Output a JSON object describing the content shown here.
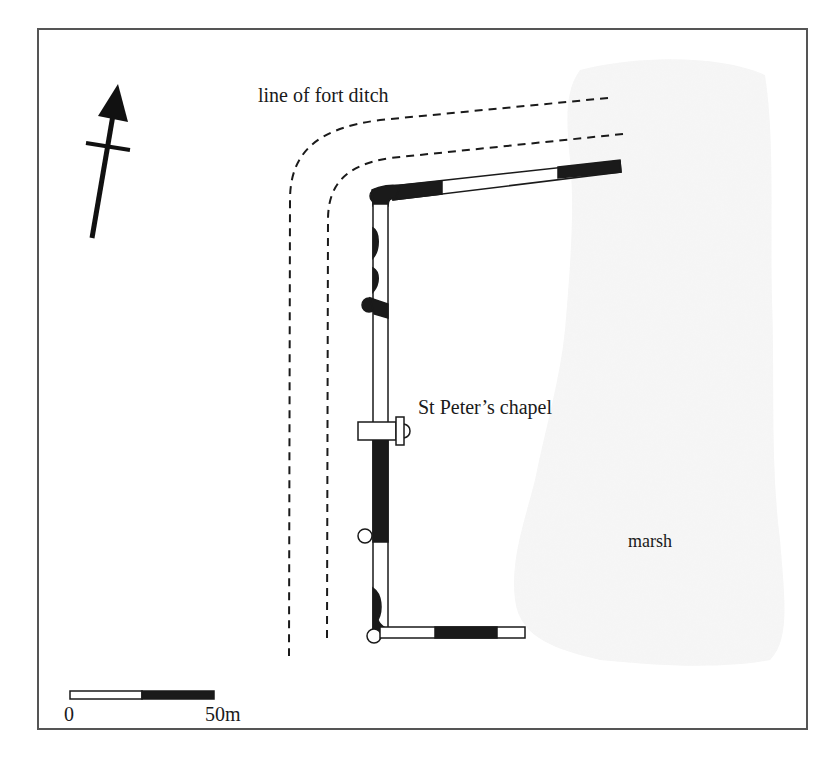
{
  "map": {
    "type": "site plan",
    "labels": {
      "fort_ditch": "line of fort ditch",
      "chapel": "St Peter’s chapel",
      "marsh": "marsh"
    },
    "north_arrow": {
      "icon": "north-arrow-icon",
      "bearing_deg": 10
    },
    "scale_bar": {
      "start_label": "0",
      "end_label": "50m",
      "segments": [
        {
          "fill": "#ffffff",
          "length_m": 25
        },
        {
          "fill": "#1a1a1a",
          "length_m": 25
        }
      ]
    },
    "colors": {
      "ink": "#1a1a1a",
      "frame": "#555555",
      "marsh_fill": "#f4f4f4",
      "background": "#ffffff"
    }
  }
}
